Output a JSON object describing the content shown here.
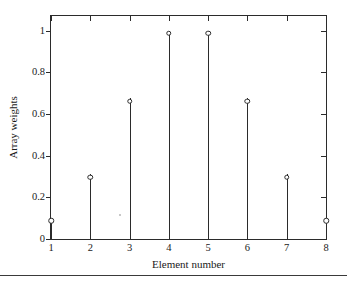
{
  "chart_data": {
    "type": "stem",
    "title": "",
    "xlabel": "Element number",
    "ylabel": "Array weights",
    "x": [
      1,
      2,
      3,
      4,
      5,
      6,
      7,
      8
    ],
    "values": [
      0.1,
      0.31,
      0.675,
      1.0,
      1.0,
      0.675,
      0.31,
      0.1
    ],
    "categories": [
      "1",
      "2",
      "3",
      "4",
      "5",
      "6",
      "7",
      "8"
    ],
    "xlim": [
      1,
      8
    ],
    "ylim": [
      0,
      1.07
    ],
    "xticks": [
      1,
      2,
      3,
      4,
      5,
      6,
      7,
      8
    ],
    "xticklabels": [
      "1",
      "2",
      "3",
      "4",
      "5",
      "6",
      "7",
      "8"
    ],
    "yticks": [
      0,
      0.2,
      0.4,
      0.6,
      0.8,
      1
    ],
    "yticklabels": [
      "0",
      "0.2",
      "0.4",
      "0.6",
      "0.8",
      "1"
    ],
    "grid": false,
    "legend": null,
    "marker": "open-circle",
    "line_color": "#2b2b2b",
    "background_color": "#ffffff"
  },
  "axes": {
    "x_title": "Element number",
    "y_title": "Array weights"
  }
}
